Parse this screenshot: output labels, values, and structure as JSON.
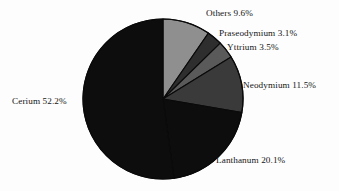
{
  "figure": {
    "background_color": "#fdfdfd",
    "text_color": "#161616"
  },
  "chart_data": {
    "type": "pie",
    "title": "",
    "subtitle": "",
    "xlabel": "",
    "ylabel": "",
    "units": "percent",
    "total": 100.0,
    "start_angle_deg": 0,
    "direction": "clockwise",
    "legend_position": "none",
    "labels_position": "outside",
    "grid": false,
    "categories": [
      "Others",
      "Praseodymium",
      "Yttrium",
      "Neodymium",
      "Lanthanum",
      "Cerium"
    ],
    "values": [
      9.6,
      3.1,
      3.5,
      11.5,
      20.1,
      52.2
    ],
    "colors": [
      "#8f8f8f",
      "#2e2e2e",
      "#5a5a5a",
      "#3a3a3a",
      "#0d0d0d",
      "#0d0d0d"
    ],
    "slices": [
      {
        "name": "Others",
        "value": 9.6,
        "label": "Others 9.6%",
        "color": "#8f8f8f"
      },
      {
        "name": "Praseodymium",
        "value": 3.1,
        "label": "Praseodymium 3.1%",
        "color": "#2e2e2e"
      },
      {
        "name": "Yttrium",
        "value": 3.5,
        "label": "Yttrium 3.5%",
        "color": "#5a5a5a"
      },
      {
        "name": "Neodymium",
        "value": 11.5,
        "label": "Neodymium 11.5%",
        "color": "#3a3a3a"
      },
      {
        "name": "Lanthanum",
        "value": 20.1,
        "label": "Lanthanum 20.1%",
        "color": "#0d0d0d"
      },
      {
        "name": "Cerium",
        "value": 52.2,
        "label": "Cerium 52.2%",
        "color": "#0d0d0d"
      }
    ]
  },
  "labels": {
    "others": "Others 9.6%",
    "praseodymium": "Praseodymium 3.1%",
    "yttrium": "Yttrium 3.5%",
    "neodymium": "Neodymium 11.5%",
    "cerium": "Cerium 52.2%",
    "lanthanum": "Lanthanum 20.1%"
  }
}
